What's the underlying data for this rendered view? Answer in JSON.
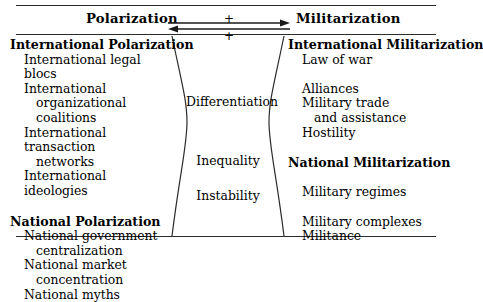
{
  "figure": {
    "name": "polarization-militarization-diagram"
  },
  "header": {
    "left_label": "Polarization",
    "right_label": "Militarization",
    "plus_top": "+",
    "plus_bottom": "+",
    "arrow_right_name": "arrow-right",
    "arrow_left_name": "arrow-left"
  },
  "left_column": {
    "groups": [
      {
        "heading": "International Polarization",
        "items": [
          {
            "line1": "International legal blocs",
            "line2": ""
          },
          {
            "line1": "International",
            "line2": "organizational coalitions"
          },
          {
            "line1": "International transaction",
            "line2": "networks"
          },
          {
            "line1": "International ideologies",
            "line2": ""
          }
        ]
      },
      {
        "heading": "National Polarization",
        "items": [
          {
            "line1": "National government",
            "line2": "centralization"
          },
          {
            "line1": "National market",
            "line2": "concentration"
          },
          {
            "line1": "National myths",
            "line2": ""
          }
        ]
      }
    ]
  },
  "center_column": {
    "terms": [
      {
        "label": "Differentiation"
      },
      {
        "label": "Inequality"
      },
      {
        "label": "Instability"
      }
    ]
  },
  "right_column": {
    "groups": [
      {
        "heading": "International Militarization",
        "items": [
          {
            "line1": "Law of war",
            "line2": ""
          },
          {
            "line1": "",
            "line2": ""
          },
          {
            "line1": "Alliances",
            "line2": ""
          },
          {
            "line1": "Military trade",
            "line2": "and assistance"
          },
          {
            "line1": "Hostility",
            "line2": ""
          }
        ]
      },
      {
        "heading": "National Militarization",
        "items": [
          {
            "line1": "",
            "line2": ""
          },
          {
            "line1": "Military regimes",
            "line2": ""
          },
          {
            "line1": "",
            "line2": ""
          },
          {
            "line1": "Military complexes",
            "line2": ""
          },
          {
            "line1": "Militance",
            "line2": ""
          }
        ]
      }
    ]
  },
  "colors": {
    "ink": "#000000",
    "rule": "#2b2b2b",
    "background": "#ffffff"
  }
}
